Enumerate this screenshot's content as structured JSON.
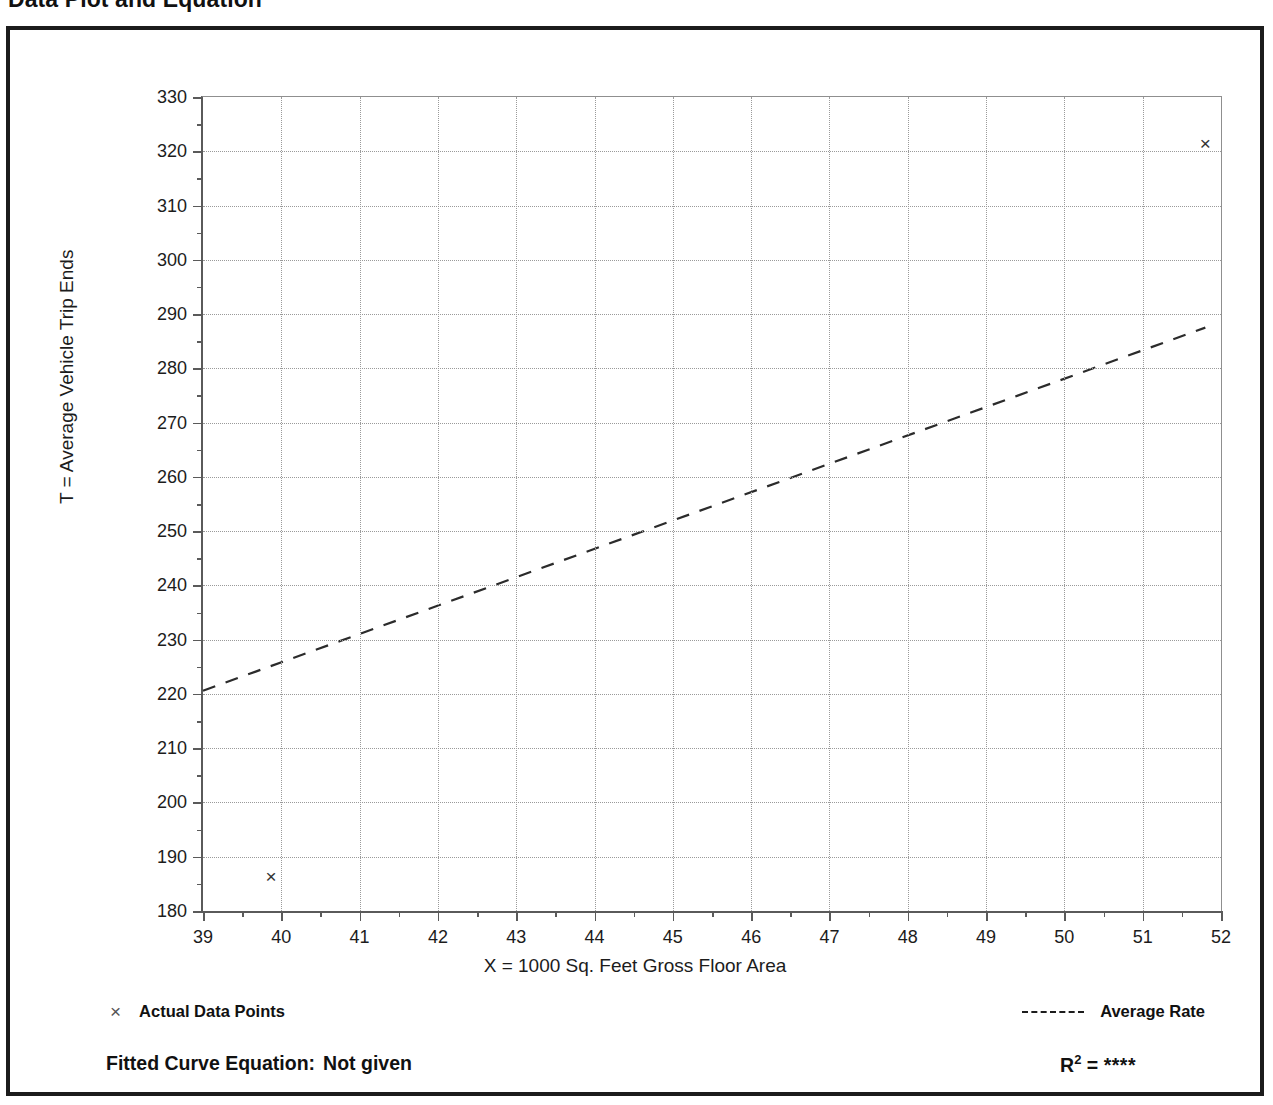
{
  "document": {
    "title": "Data Plot and Equation",
    "subtitle_faint": ""
  },
  "legend": {
    "data_points_label": "Actual Data Points",
    "data_points_marker": "x-marker-icon",
    "average_rate_label": "Average Rate",
    "average_rate_marker": "dashed-line-icon"
  },
  "equation": {
    "fitted_label": "Fitted Curve Equation:",
    "fitted_value": "Not given",
    "r_label": "R",
    "r_exponent": "2",
    "r_equals": "=",
    "r_value": "****"
  },
  "chart_data": {
    "type": "scatter",
    "title": "Data Plot and Equation",
    "xlabel": "X = 1000 Sq. Feet Gross Floor Area",
    "ylabel": "T = Average Vehicle Trip Ends",
    "xlim": [
      39,
      52
    ],
    "ylim": [
      180,
      330
    ],
    "xticks": [
      39,
      40,
      41,
      42,
      43,
      44,
      45,
      46,
      47,
      48,
      49,
      50,
      51,
      52
    ],
    "yticks": [
      180,
      190,
      200,
      210,
      220,
      230,
      240,
      250,
      260,
      270,
      280,
      290,
      300,
      310,
      320,
      330
    ],
    "xtick_labels": [
      "39",
      "40",
      "41",
      "42",
      "43",
      "44",
      "45",
      "46",
      "47",
      "48",
      "49",
      "50",
      "51",
      "52"
    ],
    "ytick_labels": [
      "180",
      "190",
      "200",
      "210",
      "220",
      "230",
      "240",
      "250",
      "260",
      "270",
      "280",
      "290",
      "300",
      "310",
      "320",
      "330"
    ],
    "x_minor_step": 0.5,
    "y_minor_step": 5,
    "grid": true,
    "legend_position": "below-axes",
    "series": [
      {
        "name": "Actual Data Points",
        "type": "scatter",
        "marker": "x",
        "points": [
          {
            "x": 39.87,
            "y": 186.4
          },
          {
            "x": 51.8,
            "y": 321.4
          }
        ]
      },
      {
        "name": "Average Rate",
        "type": "line",
        "style": "dashed",
        "points": [
          {
            "x": 39.0,
            "y": 220.6
          },
          {
            "x": 51.8,
            "y": 287.5
          }
        ]
      }
    ]
  }
}
